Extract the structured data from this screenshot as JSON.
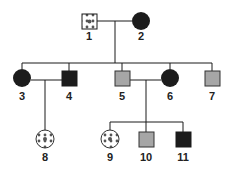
{
  "pedigree": {
    "colors": {
      "affected": "#1c1c1c",
      "carrier_gray": "#a6a6a6",
      "pattern_fill": "#ffffff",
      "pattern_dot": "#555555",
      "line": "#1a1a1a"
    },
    "individuals": [
      {
        "id": "1",
        "label": "1",
        "sex": "male",
        "fill": "patterned",
        "generation": 1
      },
      {
        "id": "2",
        "label": "2",
        "sex": "female",
        "fill": "black",
        "generation": 1
      },
      {
        "id": "3",
        "label": "3",
        "sex": "female",
        "fill": "black",
        "generation": 2
      },
      {
        "id": "4",
        "label": "4",
        "sex": "male",
        "fill": "black",
        "generation": 2
      },
      {
        "id": "5",
        "label": "5",
        "sex": "male",
        "fill": "gray",
        "generation": 2
      },
      {
        "id": "6",
        "label": "6",
        "sex": "female",
        "fill": "black",
        "generation": 2
      },
      {
        "id": "7",
        "label": "7",
        "sex": "male",
        "fill": "gray",
        "generation": 2
      },
      {
        "id": "8",
        "label": "8",
        "sex": "female",
        "fill": "patterned",
        "generation": 3
      },
      {
        "id": "9",
        "label": "9",
        "sex": "female",
        "fill": "patterned",
        "generation": 3
      },
      {
        "id": "10",
        "label": "10",
        "sex": "male",
        "fill": "gray",
        "generation": 3
      },
      {
        "id": "11",
        "label": "11",
        "sex": "male",
        "fill": "black",
        "generation": 3
      }
    ],
    "labels": {
      "i1": "1",
      "i2": "2",
      "i3": "3",
      "i4": "4",
      "i5": "5",
      "i6": "6",
      "i7": "7",
      "i8": "8",
      "i9": "9",
      "i10": "10",
      "i11": "11"
    },
    "matings": [
      {
        "partners": [
          "1",
          "2"
        ],
        "children": [
          "3",
          "5",
          "7"
        ]
      },
      {
        "partners": [
          "3",
          "4"
        ],
        "children": [
          "8"
        ]
      },
      {
        "partners": [
          "5",
          "6"
        ],
        "children": [
          "9",
          "10",
          "11"
        ]
      }
    ]
  }
}
